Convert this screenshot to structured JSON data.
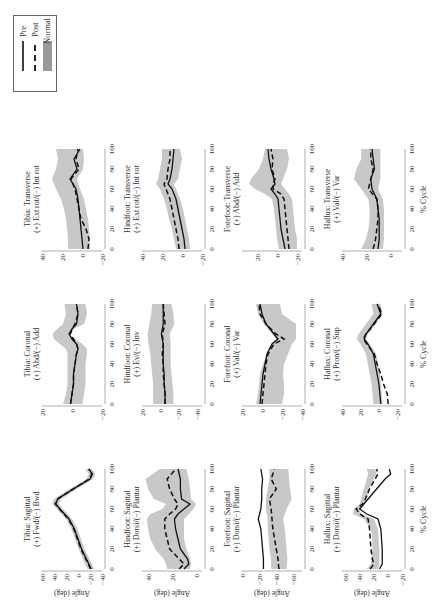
{
  "legend": {
    "items": [
      {
        "label": "Pre",
        "style": "solid",
        "color": "#111111"
      },
      {
        "label": "Post",
        "style": "dashed",
        "color": "#111111"
      },
      {
        "label": "Normal",
        "style": "band",
        "color": "#b4b4b4"
      }
    ]
  },
  "colors": {
    "pre": "#111111",
    "post": "#111111",
    "normal_band": "#c8c8c8",
    "axis": "#999999"
  },
  "chart_data": [
    {
      "type": "line",
      "row": "Tibia",
      "title": "Tibia: Sagittal",
      "subtitle": "(+) Fwd/(−) Bwd",
      "xlabel": "",
      "ylabel": "Angle (deg)",
      "ylim": [
        -40,
        60
      ],
      "yticks": [
        60,
        40,
        20,
        0,
        -20,
        -40
      ],
      "xticks": [
        0,
        20,
        40,
        60,
        80,
        100
      ],
      "x": [
        0,
        10,
        20,
        30,
        40,
        50,
        60,
        65,
        70,
        80,
        90,
        95,
        100
      ],
      "series": [
        {
          "name": "Pre",
          "values": [
            -22,
            -14,
            -6,
            0,
            6,
            15,
            30,
            37,
            34,
            8,
            -20,
            -24,
            -18
          ]
        },
        {
          "name": "Post",
          "values": [
            -21,
            -13,
            -5,
            1,
            7,
            16,
            31,
            38,
            34,
            8,
            -19,
            -23,
            -18
          ]
        }
      ],
      "normal_upper": [
        -16,
        -8,
        -1,
        5,
        11,
        20,
        35,
        43,
        40,
        14,
        -14,
        -18,
        -12
      ],
      "normal_lower": [
        -27,
        -19,
        -11,
        -5,
        1,
        10,
        25,
        32,
        28,
        2,
        -25,
        -29,
        -23
      ]
    },
    {
      "type": "line",
      "row": "Tibia",
      "title": "Tibia: Coronal",
      "subtitle": "(+) Abd/(−) Add",
      "xlabel": "",
      "ylabel": "",
      "ylim": [
        -20,
        20
      ],
      "yticks": [
        20,
        0,
        -20
      ],
      "xticks": [
        0,
        20,
        40,
        60,
        80,
        100
      ],
      "x": [
        0,
        10,
        20,
        30,
        40,
        50,
        55,
        60,
        65,
        70,
        75,
        80,
        90,
        100
      ],
      "series": [
        {
          "name": "Pre",
          "values": [
            1,
            0,
            -1,
            -1,
            -2,
            -3,
            -4,
            -3,
            0,
            2,
            0,
            -3,
            -4,
            -3
          ]
        },
        {
          "name": "Post",
          "values": [
            1,
            0,
            -1,
            -1,
            -2,
            -3,
            -4,
            -3,
            -1,
            1,
            0,
            -2,
            -4,
            -3
          ]
        }
      ],
      "normal_upper": [
        6,
        4,
        3,
        3,
        3,
        3,
        4,
        8,
        12,
        13,
        10,
        6,
        4,
        5
      ],
      "normal_lower": [
        -7,
        -8,
        -9,
        -9,
        -9,
        -10,
        -10,
        -7,
        -2,
        2,
        -1,
        -8,
        -10,
        -9
      ]
    },
    {
      "type": "line",
      "row": "Tibia",
      "title": "Tibia: Transverse",
      "subtitle": "(+) Ext rot/(−) Int rot",
      "xlabel": "",
      "ylabel": "",
      "ylim": [
        -20,
        40
      ],
      "yticks": [
        40,
        20,
        0,
        -20
      ],
      "xticks": [
        0,
        20,
        40,
        60,
        80,
        100
      ],
      "x": [
        0,
        10,
        20,
        30,
        40,
        50,
        60,
        70,
        80,
        90,
        100
      ],
      "series": [
        {
          "name": "Pre",
          "values": [
            -1,
            0,
            1,
            2,
            3,
            4,
            6,
            12,
            5,
            8,
            2
          ]
        },
        {
          "name": "Post",
          "values": [
            -6,
            -7,
            -4,
            1,
            3,
            5,
            7,
            11,
            3,
            6,
            4
          ]
        }
      ],
      "normal_upper": [
        14,
        14,
        15,
        16,
        18,
        21,
        26,
        30,
        26,
        24,
        26
      ],
      "normal_lower": [
        -8,
        -8,
        -7,
        -6,
        -4,
        -2,
        2,
        5,
        -1,
        -2,
        -1
      ]
    },
    {
      "type": "line",
      "row": "Hindfoot",
      "title": "Hindfoot: Sagittal",
      "subtitle": "(+) Dorsi/(−) Plantar",
      "xlabel": "",
      "ylabel": "Angle (deg)",
      "ylim": [
        -5,
        45
      ],
      "yticks": [
        40,
        20,
        0
      ],
      "xticks": [
        0,
        20,
        40,
        60,
        80,
        100
      ],
      "x": [
        0,
        5,
        10,
        20,
        30,
        40,
        50,
        55,
        60,
        65,
        70,
        80,
        90,
        100
      ],
      "series": [
        {
          "name": "Pre",
          "values": [
            10,
            6,
            7,
            13,
            15,
            17,
            18,
            15,
            10,
            5,
            12,
            13,
            13,
            15
          ]
        },
        {
          "name": "Post",
          "values": [
            14,
            10,
            14,
            22,
            24,
            26,
            26,
            22,
            17,
            15,
            18,
            22,
            24,
            17
          ]
        }
      ],
      "normal_upper": [
        24,
        25,
        27,
        34,
        38,
        40,
        41,
        38,
        28,
        25,
        35,
        40,
        42,
        30
      ],
      "normal_lower": [
        5,
        4,
        5,
        8,
        10,
        10,
        10,
        6,
        2,
        0,
        4,
        5,
        6,
        8
      ]
    },
    {
      "type": "line",
      "row": "Hindfoot",
      "title": "Hindfoot: Coronal",
      "subtitle": "(+) Ev/(−) Inv",
      "xlabel": "",
      "ylabel": "",
      "ylim": [
        -45,
        20
      ],
      "yticks": [
        20,
        0,
        -20,
        -40
      ],
      "xticks": [
        0,
        20,
        40,
        60,
        80,
        100
      ],
      "x": [
        0,
        10,
        20,
        30,
        40,
        50,
        60,
        70,
        80,
        90,
        100
      ],
      "series": [
        {
          "name": "Pre",
          "values": [
            -5,
            -5,
            -4,
            -4,
            -3,
            -3,
            -3,
            -1,
            -3,
            -3,
            -3
          ]
        },
        {
          "name": "Post",
          "values": [
            -5,
            -5,
            -4,
            -3,
            -3,
            -2,
            -3,
            -2,
            -5,
            -4,
            -3
          ]
        }
      ],
      "normal_upper": [
        8,
        8,
        8,
        9,
        10,
        11,
        13,
        14,
        12,
        10,
        9
      ],
      "normal_lower": [
        -14,
        -14,
        -13,
        -12,
        -11,
        -11,
        -11,
        -10,
        -15,
        -14,
        -12
      ]
    },
    {
      "type": "line",
      "row": "Hindfoot",
      "title": "Hindfoot: Transverse",
      "subtitle": "(+) Ext rot/(−) Int rot",
      "xlabel": "",
      "ylabel": "",
      "ylim": [
        -20,
        40
      ],
      "yticks": [
        40,
        20,
        0,
        -20
      ],
      "xticks": [
        0,
        20,
        40,
        60,
        80,
        100
      ],
      "x": [
        0,
        10,
        20,
        30,
        40,
        50,
        60,
        65,
        70,
        80,
        90,
        100
      ],
      "series": [
        {
          "name": "Pre",
          "values": [
            -3,
            -2,
            0,
            2,
            4,
            6,
            10,
            14,
            12,
            10,
            9,
            8
          ]
        },
        {
          "name": "Post",
          "values": [
            3,
            4,
            6,
            8,
            10,
            12,
            16,
            18,
            15,
            14,
            12,
            12
          ]
        }
      ],
      "normal_upper": [
        6,
        8,
        10,
        13,
        15,
        18,
        22,
        26,
        24,
        22,
        20,
        20
      ],
      "normal_lower": [
        -8,
        -7,
        -5,
        -3,
        -1,
        2,
        6,
        8,
        4,
        2,
        0,
        2
      ]
    },
    {
      "type": "line",
      "row": "Forefoot",
      "title": "Forefoot: Sagittal",
      "subtitle": "(+) Dorsi/(−) Plantar",
      "xlabel": "",
      "ylabel": "Angle (deg)",
      "ylim": [
        -70,
        0
      ],
      "yticks": [
        0,
        -20,
        -40,
        -60
      ],
      "xticks": [
        0,
        20,
        40,
        60,
        80,
        100
      ],
      "x": [
        0,
        10,
        20,
        30,
        40,
        50,
        60,
        70,
        80,
        90,
        100
      ],
      "series": [
        {
          "name": "Pre",
          "values": [
            -25,
            -25,
            -24,
            -23,
            -22,
            -19,
            -22,
            -23,
            -23,
            -24,
            -22
          ]
        },
        {
          "name": "Post",
          "values": [
            -43,
            -42,
            -40,
            -38,
            -36,
            -35,
            -34,
            -32,
            -40,
            -34,
            -38
          ]
        }
      ],
      "normal_upper": [
        -34,
        -34,
        -32,
        -31,
        -30,
        -30,
        -28,
        -28,
        -30,
        -32,
        -32
      ],
      "normal_lower": [
        -52,
        -53,
        -52,
        -51,
        -50,
        -48,
        -52,
        -58,
        -56,
        -55,
        -54
      ]
    },
    {
      "type": "line",
      "row": "Forefoot",
      "title": "Forefoot: Coronal",
      "subtitle": "(+) Val/(−) Var",
      "xlabel": "",
      "ylabel": "",
      "ylim": [
        -40,
        20
      ],
      "yticks": [
        20,
        0,
        -20,
        -40
      ],
      "xticks": [
        0,
        20,
        40,
        60,
        80,
        100
      ],
      "x": [
        0,
        10,
        20,
        30,
        40,
        50,
        60,
        65,
        70,
        80,
        90,
        100
      ],
      "series": [
        {
          "name": "Pre",
          "values": [
            2,
            1,
            0,
            -1,
            -3,
            -5,
            -10,
            -16,
            -12,
            -4,
            0,
            2
          ]
        },
        {
          "name": "Post",
          "values": [
            0,
            -1,
            -2,
            -3,
            -4,
            -6,
            -12,
            -22,
            -14,
            -4,
            2,
            3
          ]
        }
      ],
      "normal_upper": [
        6,
        4,
        3,
        2,
        -1,
        -5,
        -10,
        -14,
        -10,
        -2,
        4,
        6
      ],
      "normal_lower": [
        -20,
        -22,
        -22,
        -21,
        -22,
        -26,
        -30,
        -34,
        -34,
        -34,
        -20,
        -18
      ]
    },
    {
      "type": "line",
      "row": "Forefoot",
      "title": "Forefoot: Transverse",
      "subtitle": "(+) Abd/(−) Add",
      "xlabel": "",
      "ylabel": "",
      "ylim": [
        -25,
        35
      ],
      "yticks": [
        20,
        0,
        -20
      ],
      "xticks": [
        0,
        20,
        40,
        60,
        80,
        100
      ],
      "x": [
        0,
        10,
        20,
        30,
        40,
        50,
        55,
        60,
        65,
        70,
        80,
        90,
        100
      ],
      "series": [
        {
          "name": "Pre",
          "values": [
            -8,
            -6,
            -4,
            -3,
            -2,
            -1,
            2,
            6,
            2,
            3,
            6,
            8,
            9
          ]
        },
        {
          "name": "Post",
          "values": [
            -12,
            -11,
            -10,
            -9,
            -8,
            -7,
            -4,
            4,
            4,
            2,
            5,
            4,
            6
          ]
        }
      ],
      "normal_upper": [
        -2,
        0,
        1,
        2,
        3,
        5,
        12,
        22,
        28,
        26,
        18,
        14,
        12
      ],
      "normal_lower": [
        -20,
        -20,
        -18,
        -17,
        -16,
        -15,
        -12,
        -8,
        -4,
        -6,
        -10,
        -12,
        -10
      ]
    },
    {
      "type": "line",
      "row": "Hallux",
      "title": "Hallux: Sagittal",
      "subtitle": "(+) Dorsi/(−) Plantar",
      "xlabel": "% Cycle",
      "ylabel": "Angle (deg)",
      "ylim": [
        -20,
        65
      ],
      "yticks": [
        60,
        40,
        20,
        0,
        -20
      ],
      "xticks": [
        0,
        20,
        40,
        60,
        80,
        100
      ],
      "x": [
        0,
        5,
        10,
        20,
        30,
        40,
        50,
        55,
        60,
        65,
        70,
        80,
        90,
        95,
        100
      ],
      "series": [
        {
          "name": "Pre",
          "values": [
            12,
            8,
            8,
            8,
            9,
            10,
            14,
            30,
            40,
            34,
            28,
            16,
            4,
            -4,
            -2
          ]
        },
        {
          "name": "Post",
          "values": [
            25,
            20,
            22,
            24,
            25,
            26,
            28,
            40,
            45,
            36,
            32,
            26,
            18,
            14,
            16
          ]
        }
      ],
      "normal_upper": [
        30,
        24,
        23,
        22,
        22,
        24,
        34,
        50,
        48,
        40,
        38,
        34,
        30,
        28,
        30
      ],
      "normal_lower": [
        14,
        12,
        12,
        12,
        13,
        14,
        20,
        38,
        40,
        34,
        30,
        26,
        20,
        16,
        18
      ]
    },
    {
      "type": "line",
      "row": "Hallux",
      "title": "Hallux: Coronal",
      "subtitle": "(+) Pron/(−) Sup",
      "xlabel": "% Cycle",
      "ylabel": "",
      "ylim": [
        -25,
        40
      ],
      "yticks": [
        40,
        20,
        0,
        -20
      ],
      "xticks": [
        0,
        20,
        40,
        60,
        80,
        100
      ],
      "x": [
        0,
        10,
        20,
        30,
        40,
        50,
        60,
        65,
        70,
        80,
        90,
        100
      ],
      "series": [
        {
          "name": "Pre",
          "values": [
            -2,
            -1,
            0,
            2,
            4,
            6,
            12,
            16,
            14,
            6,
            -2,
            2
          ]
        },
        {
          "name": "Post",
          "values": [
            -10,
            -9,
            -5,
            -2,
            2,
            5,
            13,
            17,
            14,
            5,
            -3,
            1
          ]
        }
      ],
      "normal_upper": [
        6,
        7,
        8,
        10,
        12,
        14,
        20,
        24,
        22,
        14,
        6,
        8
      ],
      "normal_lower": [
        -4,
        -3,
        -2,
        -1,
        1,
        3,
        10,
        14,
        12,
        4,
        -4,
        -2
      ]
    },
    {
      "type": "line",
      "row": "Hallux",
      "title": "Hallux: Transverse",
      "subtitle": "(+) Val/(−) Var",
      "xlabel": "% Cycle",
      "ylabel": "",
      "ylim": [
        -10,
        40
      ],
      "yticks": [
        40,
        20,
        0
      ],
      "xticks": [
        0,
        20,
        40,
        60,
        80,
        100
      ],
      "x": [
        0,
        10,
        20,
        30,
        40,
        50,
        60,
        70,
        80,
        90,
        100
      ],
      "series": [
        {
          "name": "Pre",
          "values": [
            10,
            9,
            9,
            9,
            10,
            11,
            15,
            16,
            13,
            14,
            15
          ]
        },
        {
          "name": "Post",
          "values": [
            14,
            12,
            11,
            10,
            10,
            11,
            18,
            16,
            14,
            16,
            16
          ]
        }
      ],
      "normal_upper": [
        24,
        20,
        18,
        17,
        17,
        18,
        24,
        30,
        28,
        24,
        24
      ],
      "normal_lower": [
        6,
        5,
        5,
        5,
        5,
        6,
        10,
        8,
        8,
        8,
        8
      ]
    }
  ]
}
